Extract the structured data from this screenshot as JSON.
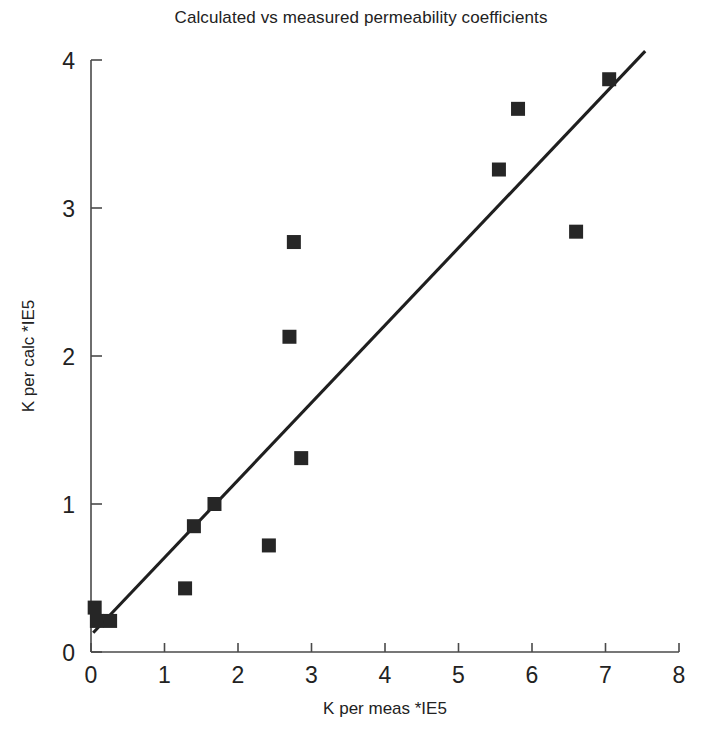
{
  "chart_data": {
    "type": "scatter",
    "title": "Calculated vs measured permeability coefficients",
    "xlabel": "K per meas *IE5",
    "ylabel": "K per calc *IE5",
    "xlim": [
      0,
      8
    ],
    "ylim": [
      0,
      4
    ],
    "xticks": [
      0,
      1,
      2,
      3,
      4,
      5,
      6,
      7,
      8
    ],
    "yticks": [
      0,
      1,
      2,
      3,
      4
    ],
    "xtick_labels": [
      "0",
      "1",
      "2",
      "3",
      "4",
      "5",
      "6",
      "7",
      "8"
    ],
    "ytick_labels": [
      "0",
      "1",
      "2",
      "3",
      "4"
    ],
    "grid": false,
    "legend": false,
    "marker": "square",
    "marker_color": "#262626",
    "line_color": "#1f1f1f",
    "series": [
      {
        "name": "K calc vs K meas",
        "points": [
          {
            "x": 0.05,
            "y": 0.3
          },
          {
            "x": 0.08,
            "y": 0.21
          },
          {
            "x": 0.26,
            "y": 0.21
          },
          {
            "x": 1.28,
            "y": 0.43
          },
          {
            "x": 1.4,
            "y": 0.85
          },
          {
            "x": 1.68,
            "y": 1.0
          },
          {
            "x": 2.42,
            "y": 0.72
          },
          {
            "x": 2.7,
            "y": 2.13
          },
          {
            "x": 2.76,
            "y": 2.77
          },
          {
            "x": 2.86,
            "y": 1.31
          },
          {
            "x": 5.55,
            "y": 3.26
          },
          {
            "x": 5.81,
            "y": 3.67
          },
          {
            "x": 6.6,
            "y": 2.84
          },
          {
            "x": 7.05,
            "y": 3.87
          }
        ]
      }
    ],
    "trend_line": {
      "name": "fit-line",
      "x_start": 0.03,
      "y_start": 0.13,
      "x_end": 7.54,
      "y_end": 4.06
    }
  }
}
